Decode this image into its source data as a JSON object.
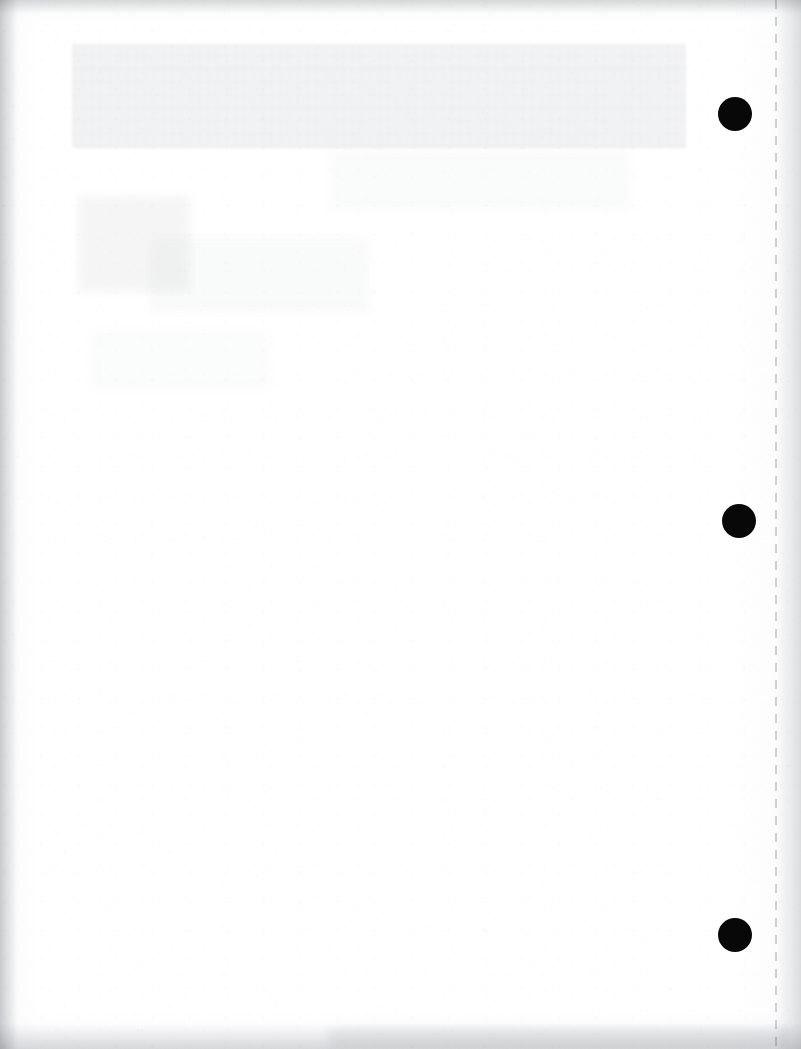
{
  "page": {
    "kind": "scanned-document-page",
    "content_description": "blank scanned sheet",
    "width": 801,
    "height": 1049,
    "visible_text": "",
    "paper_color": "#ffffff",
    "ink_color": "#080808"
  },
  "artifacts": {
    "ghost_band": {
      "label": "",
      "color": "#e9eaec",
      "x": 72,
      "y": 44,
      "width": 614,
      "height": 104
    },
    "smudges": [
      {
        "label": "",
        "color": "#eceded",
        "x": 78,
        "y": 196,
        "width": 112,
        "height": 96,
        "opacity": 0.55
      },
      {
        "label": "",
        "color": "#f0f1f1",
        "x": 150,
        "y": 238,
        "width": 220,
        "height": 74,
        "opacity": 0.4
      },
      {
        "label": "",
        "color": "#f1f2f2",
        "x": 330,
        "y": 150,
        "width": 300,
        "height": 60,
        "opacity": 0.35
      },
      {
        "label": "",
        "color": "#f2f3f3",
        "x": 90,
        "y": 330,
        "width": 180,
        "height": 60,
        "opacity": 0.3
      }
    ],
    "bottom_smudge": {
      "label": "",
      "color": "#edeeef"
    },
    "perforation_line": {
      "label": "",
      "x": 775,
      "color": "#787d82"
    }
  },
  "marks": {
    "punch_holes": [
      {
        "label": "",
        "cx": 735,
        "cy": 114,
        "diameter": 34
      },
      {
        "label": "",
        "cx": 739,
        "cy": 521,
        "diameter": 34
      },
      {
        "label": "",
        "cx": 735,
        "cy": 935,
        "diameter": 34
      }
    ]
  }
}
